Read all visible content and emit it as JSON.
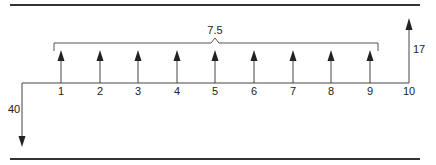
{
  "diagram": {
    "type": "cash-flow-timeline",
    "periods": [
      "1",
      "2",
      "3",
      "4",
      "5",
      "6",
      "7",
      "8",
      "9",
      "10"
    ],
    "annuity": {
      "label": "7.5",
      "from_period": 1,
      "to_period": 9,
      "direction": "inflow"
    },
    "final_inflow": {
      "label": "17",
      "period": 10,
      "direction": "inflow"
    },
    "initial_outflow": {
      "label": "40",
      "period": 0,
      "direction": "outflow"
    },
    "colors": {
      "line": "#222222",
      "rule": "#333333"
    }
  }
}
